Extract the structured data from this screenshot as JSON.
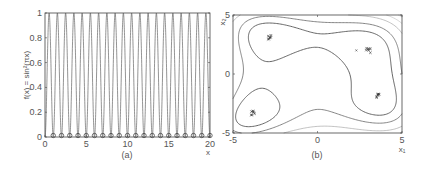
{
  "chart_data": [
    {
      "panel": "a",
      "type": "line",
      "caption": "(a)",
      "title": "",
      "xlabel": "x",
      "ylabel": "f(x) = sin²(πx)",
      "xlim": [
        0,
        20
      ],
      "ylim": [
        0,
        1
      ],
      "xticks": [
        0,
        5,
        10,
        15,
        20
      ],
      "yticks": [
        0,
        0.2,
        0.4,
        0.6,
        0.8,
        1
      ],
      "ytick_labels": [
        "0",
        "0.2",
        "0.4",
        "0.6",
        "0.8",
        "1"
      ],
      "function": "sin^2(pi*x)",
      "series": [
        {
          "name": "f(x)",
          "style": "line",
          "color": "#555555"
        },
        {
          "name": "found optima",
          "style": "circle-markers",
          "color": "#333333",
          "x": [
            1,
            2,
            3,
            4,
            5,
            6,
            7,
            8,
            9,
            10,
            11,
            12,
            13,
            14,
            15,
            16,
            17,
            18,
            19,
            20
          ],
          "y": [
            0,
            0,
            0,
            0,
            0,
            0,
            0,
            0,
            0,
            0,
            0,
            0,
            0,
            0,
            0,
            0,
            0,
            0,
            0,
            0
          ]
        }
      ],
      "grid": false
    },
    {
      "panel": "b",
      "type": "contour",
      "caption": "(b)",
      "title": "",
      "xlabel": "x₁",
      "ylabel": "x₂",
      "xlim": [
        -5,
        5
      ],
      "ylim": [
        -5,
        5
      ],
      "xticks": [
        -5,
        0,
        5
      ],
      "yticks": [
        -5,
        0,
        5
      ],
      "minima_clusters": [
        {
          "x1": -2.8,
          "x2": 3.1
        },
        {
          "x1": 3.0,
          "x2": 2.0
        },
        {
          "x1": 3.6,
          "x2": -1.8
        },
        {
          "x1": -3.8,
          "x2": -3.3
        }
      ],
      "grid": false
    }
  ],
  "captions": {
    "a": "(a)",
    "b": "(b)"
  },
  "axes": {
    "a": {
      "xlabel": "x",
      "ylabel": "f(x) = sin²(πx)",
      "xtick_labels": [
        "0",
        "5",
        "10",
        "15",
        "20"
      ],
      "ytick_labels": [
        "0",
        "0.2",
        "0.4",
        "0.6",
        "0.8",
        "1"
      ]
    },
    "b": {
      "xlabel": "x₁",
      "ylabel": "x₂",
      "xtick_labels": [
        "-5",
        "0",
        "5"
      ],
      "ytick_labels": [
        "-5",
        "0",
        "5"
      ]
    }
  }
}
